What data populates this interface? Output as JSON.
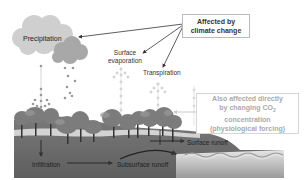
{
  "diagram": {
    "type": "water-cycle",
    "labels": {
      "precipitation": "Precipitation",
      "surface_evaporation_line1": "Surface",
      "surface_evaporation_line2": "evaporation",
      "transpiration": "Transpiration",
      "infiltration": "Infiltration",
      "subsurface_runoff": "Subsurface runoff",
      "surface_runoff": "Surface runoff"
    },
    "callouts": {
      "climate_change_line1": "Affected by",
      "climate_change_line2": "climate change",
      "co2_line1": "Also affected directly",
      "co2_line2_prefix": "by changing CO",
      "co2_line2_subscript": "2",
      "co2_line3": "concentration",
      "co2_line4": "(physiological forcing)"
    },
    "colors": {
      "ground": "#6f6f6f",
      "tree_canopy": "#7a7a7a",
      "cloud_light": "#cfcfcf",
      "cloud_dark": "#a8a8a8",
      "arrow": "#333333",
      "faint_arrow": "#cccccc",
      "water": "#bdbdbd"
    }
  }
}
